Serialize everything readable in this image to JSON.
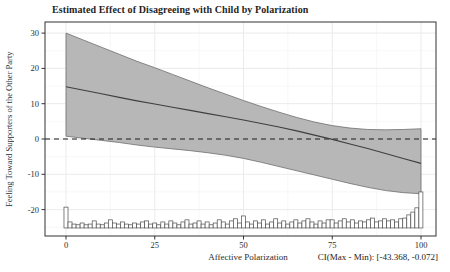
{
  "chart_data": {
    "type": "line",
    "title": "Estimated Effect of Disagreeing with Child by Polarization",
    "xlabel": "Affective Polarization",
    "ylabel": "Feeling Toward Supporters of the Other Party",
    "annotation": "CI(Max - Min): [-43.368, -0.072]",
    "x": [
      0,
      5,
      10,
      15,
      20,
      25,
      30,
      35,
      40,
      45,
      50,
      55,
      60,
      65,
      70,
      75,
      80,
      85,
      90,
      95,
      100
    ],
    "series": [
      {
        "name": "estimated-effect",
        "values": [
          14.8,
          13.8,
          12.8,
          11.8,
          10.8,
          9.9,
          9.0,
          8.1,
          7.2,
          6.3,
          5.4,
          4.4,
          3.4,
          2.3,
          1.1,
          -0.1,
          -1.4,
          -2.7,
          -4.1,
          -5.5,
          -6.9
        ]
      },
      {
        "name": "ci-upper",
        "values": [
          30.0,
          28.0,
          26.0,
          24.0,
          22.0,
          20.2,
          18.3,
          16.4,
          14.5,
          12.7,
          10.9,
          9.2,
          7.6,
          6.1,
          4.8,
          3.8,
          3.1,
          2.7,
          2.6,
          2.7,
          2.9
        ]
      },
      {
        "name": "ci-lower",
        "values": [
          0.8,
          0.2,
          -0.4,
          -1.0,
          -1.7,
          -2.3,
          -2.8,
          -3.3,
          -3.9,
          -4.6,
          -5.5,
          -6.6,
          -7.8,
          -9.0,
          -10.2,
          -11.4,
          -12.6,
          -13.7,
          -14.6,
          -15.2,
          -15.5
        ]
      }
    ],
    "reference_line_y": 0,
    "xticks": [
      0,
      25,
      50,
      75,
      100
    ],
    "yticks": [
      30,
      20,
      10,
      0,
      -10,
      -20
    ],
    "xlim": [
      -6,
      104
    ],
    "ylim": [
      -27.5,
      33
    ],
    "grid": true,
    "legend": "none",
    "histogram": {
      "start_x": 0,
      "bin_width": 1.136,
      "baseline_y": -25.2,
      "heights": [
        5.9,
        1.7,
        1.1,
        0.9,
        1.4,
        0.9,
        1.1,
        2.0,
        1.1,
        0.9,
        1.4,
        2.3,
        1.4,
        1.1,
        1.7,
        1.1,
        0.9,
        1.4,
        1.1,
        1.7,
        2.0,
        1.1,
        1.4,
        0.9,
        1.7,
        1.1,
        2.0,
        1.4,
        0.9,
        1.7,
        2.3,
        1.1,
        1.4,
        2.0,
        1.1,
        1.7,
        0.9,
        1.4,
        2.3,
        1.7,
        1.1,
        2.0,
        2.6,
        1.4,
        3.4,
        1.7,
        1.1,
        2.0,
        1.4,
        2.3,
        1.1,
        1.7,
        2.6,
        1.4,
        2.0,
        1.1,
        1.7,
        2.3,
        1.4,
        2.0,
        2.6,
        1.7,
        1.1,
        2.0,
        1.4,
        2.3,
        2.3,
        1.4,
        2.0,
        2.6,
        1.7,
        2.3,
        1.4,
        2.0,
        1.7,
        2.3,
        2.8,
        1.7,
        2.0,
        2.6,
        2.0,
        2.3,
        1.7,
        2.6,
        2.8,
        3.7,
        4.5,
        5.7,
        10.2
      ]
    },
    "colors": {
      "band_fill": "#b7b7b7",
      "band_edge": "#6e6e6e",
      "line": "#3f3f3f",
      "reference_line": "#1a1a1a",
      "grid_major": "#e9e9e9",
      "grid_minor": "#f4f4f4",
      "panel_border": "#333333",
      "hist_fill": "#ffffff",
      "hist_edge": "#4d4d4d",
      "text": "#1f1f1f"
    }
  }
}
